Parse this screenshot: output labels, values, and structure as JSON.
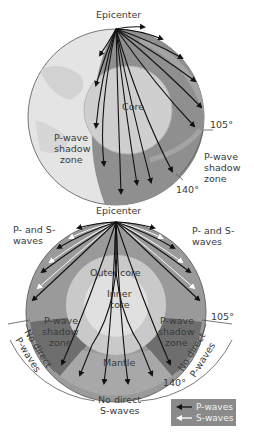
{
  "diagram": {
    "top": {
      "title": "Epicenter",
      "core_label": "Core",
      "left_zone": [
        "P-wave",
        "shadow",
        "zone"
      ],
      "right_zone": [
        "P-wave",
        "shadow",
        "zone"
      ],
      "angle_105": "105°",
      "angle_140": "140°"
    },
    "bottom": {
      "title": "Epicenter",
      "left_waves": [
        "P- and S-",
        "waves"
      ],
      "right_waves": [
        "P- and S-",
        "waves"
      ],
      "outer_core": "Outer  core",
      "inner_core": [
        "Inner",
        "core"
      ],
      "mantle": "Mantle",
      "left_shadow": [
        "P-wave",
        "shadow",
        "zone"
      ],
      "right_shadow": [
        "P-wave",
        "shadow",
        "zone"
      ],
      "left_no_direct": [
        "No direct",
        "P-waves"
      ],
      "right_no_direct": [
        "No direct",
        "P-waves"
      ],
      "no_direct_s": [
        "No direct",
        "S-waves"
      ],
      "angle_105": "105°",
      "angle_140": "140°"
    },
    "legend": {
      "p_waves": "P-waves",
      "s_waves": "S-waves"
    },
    "colors": {
      "mantle": "#8c8c8c",
      "mantle_light": "#a9a9a9",
      "core": "#c8c8c8",
      "inner_core": "#e0e0e0",
      "surface": "#e6e6e6",
      "shadow_zone": "#6e6e6e",
      "legend_bg": "#8a8a8a"
    }
  }
}
